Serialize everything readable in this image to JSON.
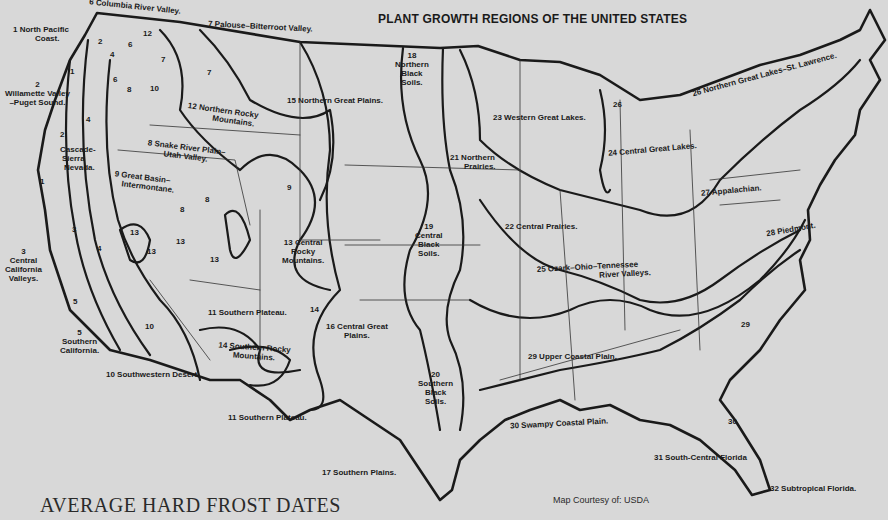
{
  "title": "PLANT GROWTH REGIONS OF THE UNITED STATES",
  "subtitle": "AVERAGE HARD FROST DATES",
  "credit": "Map Courtesy of:  USDA",
  "colors": {
    "background": "#d8d8d8",
    "ink": "#1a1a1a"
  },
  "regions": [
    {
      "num": "1",
      "line1": "1 North Pacific",
      "line2": "Coast."
    },
    {
      "num": "2",
      "line1": "2",
      "line2": "Willamette Valley",
      "line3": "–Puget Sound."
    },
    {
      "num": "3",
      "line1": "3",
      "line2": "Central",
      "line3": "California",
      "line4": "Valleys."
    },
    {
      "num": "4",
      "line1": "Cascade-",
      "line2": "Sierra",
      "line3": "Nevada."
    },
    {
      "num": "5",
      "line1": "5",
      "line2": "Southern",
      "line3": "California."
    },
    {
      "num": "6",
      "line1": "6 Columbia River Valley."
    },
    {
      "num": "7",
      "line1": "7 Palouse–Bitterroot Valley."
    },
    {
      "num": "8",
      "line1": "8 Snake River Plain–",
      "line2": "Utah Valley."
    },
    {
      "num": "9",
      "line1": "9 Great Basin–",
      "line2": "Intermontane."
    },
    {
      "num": "10",
      "line1": "10 Southwestern Desert."
    },
    {
      "num": "11",
      "line1": "11 Southern Plateau."
    },
    {
      "num": "12",
      "line1": "12 Northern Rocky",
      "line2": "Mountains."
    },
    {
      "num": "13",
      "line1": "13 Central",
      "line2": "Rocky",
      "line3": "Mountains."
    },
    {
      "num": "14",
      "line1": "14 Southern Rocky",
      "line2": "Mountains."
    },
    {
      "num": "15",
      "line1": "15 Northern Great Plains."
    },
    {
      "num": "16",
      "line1": "16 Central Great",
      "line2": "Plains."
    },
    {
      "num": "17",
      "line1": "17 Southern Plains."
    },
    {
      "num": "18",
      "line1": "18",
      "line2": "Northern",
      "line3": "Black",
      "line4": "Soils."
    },
    {
      "num": "19",
      "line1": "19",
      "line2": "Central",
      "line3": "Black",
      "line4": "Soils."
    },
    {
      "num": "20",
      "line1": "20",
      "line2": "Southern",
      "line3": "Black",
      "line4": "Soils."
    },
    {
      "num": "21",
      "line1": "21 Northern",
      "line2": "Prairies."
    },
    {
      "num": "22",
      "line1": "22 Central Prairies."
    },
    {
      "num": "23",
      "line1": "23 Western Great Lakes."
    },
    {
      "num": "24",
      "line1": "24 Central Great Lakes."
    },
    {
      "num": "25",
      "line1": "25 Ozark–Ohio–Tennessee",
      "line2": "River Valleys."
    },
    {
      "num": "26",
      "line1": "26 Northern Great Lakes–St. Lawrence."
    },
    {
      "num": "27",
      "line1": "27 Appalachian."
    },
    {
      "num": "28",
      "line1": "28 Piedmont."
    },
    {
      "num": "29",
      "line1": "29 Upper Coastal Plain."
    },
    {
      "num": "30",
      "line1": "30 Swampy Coastal Plain."
    },
    {
      "num": "31",
      "line1": "31 South-Central Florida"
    },
    {
      "num": "32",
      "line1": "32 Subtropical Florida."
    }
  ],
  "extra_numbers": {
    "n1a": "1",
    "n1b": "1",
    "n2a": "2",
    "n2b": "2",
    "n3": "3",
    "n4a": "4",
    "n4b": "4",
    "n4c": "4",
    "n5": "5",
    "n6a": "6",
    "n6b": "6",
    "n7a": "7",
    "n7b": "7",
    "n8a": "8",
    "n8b": "8",
    "n8c": "8",
    "n9a": "9",
    "n10a": "10",
    "n10b": "10",
    "n12": "12",
    "n13a": "13",
    "n13b": "13",
    "n13c": "13",
    "n13d": "13",
    "n14": "14",
    "n26": "26",
    "n29": "29",
    "n30": "30"
  }
}
